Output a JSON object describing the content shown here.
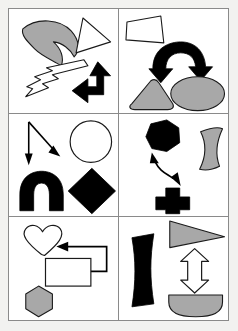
{
  "image": {
    "title": "Abstract shape panel grid",
    "width": 238,
    "height": 331,
    "background_color": "#f2f2f0",
    "panel_background": "#ffffff",
    "border_color": "#8a8a8a",
    "grid_columns": 2,
    "grid_rows": 3
  },
  "palette": {
    "black": "#000000",
    "gray": "#a8a8a8",
    "white": "#ffffff",
    "outline": "#1a1a1a",
    "frame": "#8a8a8a"
  },
  "panels": [
    {
      "id": "panel-1",
      "position": "top-left",
      "label": "Panel 1",
      "shape_count": 4,
      "shapes": [
        {
          "name": "crescent",
          "fill": "gray",
          "stroke": "black",
          "label": "Crescent"
        },
        {
          "name": "triangle",
          "fill": "white",
          "stroke": "black",
          "label": "Triangle outline"
        },
        {
          "name": "lightning-zigzag-arrow",
          "fill": "white",
          "stroke": "black",
          "label": "Zigzag lightning arrow"
        },
        {
          "name": "bent-arrow-up-left",
          "fill": "black",
          "stroke": "black",
          "label": "Bent arrow up-left"
        }
      ]
    },
    {
      "id": "panel-2",
      "position": "top-right",
      "label": "Panel 2",
      "shape_count": 4,
      "shapes": [
        {
          "name": "trapezoid",
          "fill": "white",
          "stroke": "black",
          "label": "Trapezoid outline"
        },
        {
          "name": "curved-double-arrow-arch",
          "fill": "black",
          "stroke": "black",
          "label": "Curved double arrow arch"
        },
        {
          "name": "rounded-triangle",
          "fill": "gray",
          "stroke": "black",
          "label": "Rounded triangle"
        },
        {
          "name": "ellipse",
          "fill": "gray",
          "stroke": "black",
          "label": "Ellipse"
        }
      ]
    },
    {
      "id": "panel-3",
      "position": "middle-left",
      "label": "Panel 3",
      "shape_count": 4,
      "shapes": [
        {
          "name": "arrow-down",
          "fill": "black",
          "stroke": "black",
          "label": "Straight down arrow"
        },
        {
          "name": "arrow-diagonal-down-right",
          "fill": "black",
          "stroke": "black",
          "label": "Diagonal down-right arrow"
        },
        {
          "name": "circle",
          "fill": "white",
          "stroke": "black",
          "label": "Circle outline"
        },
        {
          "name": "arch-horseshoe",
          "fill": "black",
          "stroke": "black",
          "label": "Arch horseshoe"
        },
        {
          "name": "diamond",
          "fill": "black",
          "stroke": "black",
          "label": "Diamond"
        }
      ]
    },
    {
      "id": "panel-4",
      "position": "middle-right",
      "label": "Panel 4",
      "shape_count": 4,
      "shapes": [
        {
          "name": "hexagon-blob",
          "fill": "black",
          "stroke": "black",
          "label": "Hexagon blob"
        },
        {
          "name": "wavy-ribbon",
          "fill": "gray",
          "stroke": "black",
          "label": "Wavy ribbon"
        },
        {
          "name": "curvy-double-arrow",
          "fill": "black",
          "stroke": "black",
          "label": "Curvy double-headed arrow"
        },
        {
          "name": "cross-plus",
          "fill": "black",
          "stroke": "black",
          "label": "Cross plus"
        }
      ]
    },
    {
      "id": "panel-5",
      "position": "bottom-left",
      "label": "Panel 5",
      "shape_count": 4,
      "shapes": [
        {
          "name": "heart",
          "fill": "white",
          "stroke": "black",
          "label": "Heart outline"
        },
        {
          "name": "bent-double-arrow-left",
          "fill": "black",
          "stroke": "black",
          "label": "Bent double arrow pointing left"
        },
        {
          "name": "rectangle",
          "fill": "white",
          "stroke": "black",
          "label": "Rectangle outline"
        },
        {
          "name": "hexagon",
          "fill": "gray",
          "stroke": "black",
          "label": "Hexagon"
        }
      ]
    },
    {
      "id": "panel-6",
      "position": "bottom-right",
      "label": "Panel 6",
      "shape_count": 4,
      "shapes": [
        {
          "name": "curved-vertical-bar",
          "fill": "black",
          "stroke": "black",
          "label": "Curved vertical bar"
        },
        {
          "name": "pennant-triangle-right",
          "fill": "gray",
          "stroke": "black",
          "label": "Right-pointing pennant triangle"
        },
        {
          "name": "double-arrow-vertical",
          "fill": "white",
          "stroke": "black",
          "label": "Vertical double-headed arrow outline"
        },
        {
          "name": "half-disc",
          "fill": "gray",
          "stroke": "black",
          "label": "Half disc"
        }
      ]
    }
  ]
}
